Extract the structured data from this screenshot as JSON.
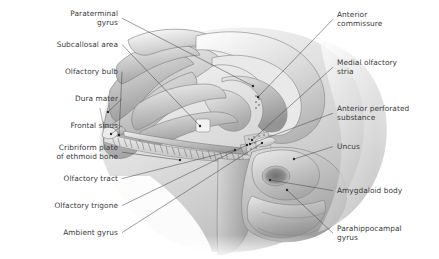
{
  "figure": {
    "type": "anatomical-illustration",
    "style": "grayscale airbrush medical illustration",
    "background_color": "#ffffff",
    "label_text_color": "#3b3b3c",
    "leader_line_color": "#4a4a4c",
    "dot_color": "#2a2a2c"
  },
  "labels_left": [
    {
      "id": "paraterminal-gyrus",
      "text": "Paraterminal\ngyrus",
      "x": 18,
      "y": 9,
      "w": 100,
      "tip_x": 253,
      "tip_y": 86
    },
    {
      "id": "subcallosal-area",
      "text": "Subcallosal area",
      "x": 18,
      "y": 40,
      "w": 100,
      "tip_x": 200,
      "tip_y": 126
    },
    {
      "id": "olfactory-bulb",
      "text": "Olfactory bulb",
      "x": 18,
      "y": 67,
      "w": 100,
      "tip_x": 119,
      "tip_y": 135
    },
    {
      "id": "dura-mater",
      "text": "Dura mater",
      "x": 18,
      "y": 94,
      "w": 100,
      "tip_x": 108,
      "tip_y": 112
    },
    {
      "id": "frontal-sinus",
      "text": "Frontal sinus",
      "x": 18,
      "y": 121,
      "w": 100,
      "tip_x": 111,
      "tip_y": 134
    },
    {
      "id": "cribriform-plate",
      "text": "Cribriform plate\nof ethmoid bone",
      "x": 8,
      "y": 143,
      "w": 110,
      "tip_x": 180,
      "tip_y": 160
    },
    {
      "id": "olfactory-tract",
      "text": "Olfactory tract",
      "x": 18,
      "y": 174,
      "w": 100,
      "tip_x": 235,
      "tip_y": 150
    },
    {
      "id": "olfactory-trigone",
      "text": "Olfactory trigone",
      "x": 18,
      "y": 201,
      "w": 100,
      "tip_x": 247,
      "tip_y": 145
    },
    {
      "id": "ambient-gyrus",
      "text": "Ambient gyrus",
      "x": 18,
      "y": 228,
      "w": 100,
      "tip_x": 262,
      "tip_y": 143
    }
  ],
  "labels_right": [
    {
      "id": "anterior-commissure",
      "text": "Anterior\ncommissure",
      "x": 337,
      "y": 10,
      "w": 98,
      "tip_x": 258,
      "tip_y": 97
    },
    {
      "id": "medial-olfactory-stria",
      "text": "Medial olfactory\nstria",
      "x": 337,
      "y": 58,
      "w": 98,
      "tip_x": 252,
      "tip_y": 140
    },
    {
      "id": "anterior-perforated-substance",
      "text": "Anterior perforated\nsubstance",
      "x": 337,
      "y": 104,
      "w": 100,
      "tip_x": 250,
      "tip_y": 144
    },
    {
      "id": "uncus",
      "text": "Uncus",
      "x": 337,
      "y": 142,
      "w": 98,
      "tip_x": 294,
      "tip_y": 159
    },
    {
      "id": "amygdaloid-body",
      "text": "Amygdaloid body",
      "x": 337,
      "y": 186,
      "w": 98,
      "tip_x": 270,
      "tip_y": 180
    },
    {
      "id": "parahippocampal-gyrus",
      "text": "Parahippocampal\ngyrus",
      "x": 337,
      "y": 224,
      "w": 98,
      "tip_x": 287,
      "tip_y": 190
    }
  ],
  "leader_dots": [
    {
      "x": 253,
      "y": 86
    },
    {
      "x": 200,
      "y": 126
    },
    {
      "x": 119,
      "y": 135
    },
    {
      "x": 108,
      "y": 112
    },
    {
      "x": 111,
      "y": 134
    },
    {
      "x": 180,
      "y": 160
    },
    {
      "x": 235,
      "y": 150
    },
    {
      "x": 247,
      "y": 145
    },
    {
      "x": 262,
      "y": 143
    },
    {
      "x": 258,
      "y": 97
    },
    {
      "x": 252,
      "y": 140
    },
    {
      "x": 250,
      "y": 144
    },
    {
      "x": 294,
      "y": 159
    },
    {
      "x": 270,
      "y": 180
    },
    {
      "x": 287,
      "y": 190
    }
  ]
}
